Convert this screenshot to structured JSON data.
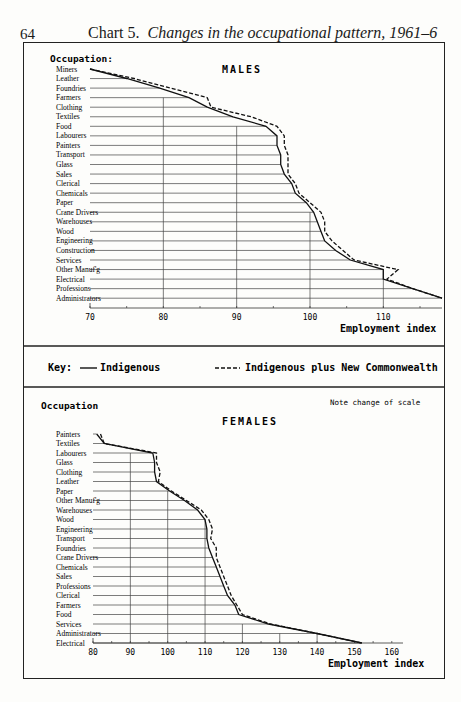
{
  "page_number": "64",
  "title_prefix": "Chart 5.",
  "title_text": "Changes in the occupational pattern, 1961–6",
  "key": {
    "label": "Key:",
    "solid_label": "Indigenous",
    "dashed_label": "Indigenous plus New Commonwealth"
  },
  "note": "Note change of scale",
  "chart_data": [
    {
      "type": "line",
      "title": "MALES",
      "ylabel": "Occupation:",
      "xlabel": "Employment index",
      "xlim": [
        70,
        118
      ],
      "xticks": [
        70,
        80,
        90,
        100,
        110
      ],
      "grid": true,
      "categories": [
        "Miners",
        "Leather",
        "Foundries",
        "Farmers",
        "Clothing",
        "Textiles",
        "Food",
        "Labourers",
        "Painters",
        "Transport",
        "Glass",
        "Sales",
        "Clerical",
        "Chemicals",
        "Paper",
        "Crane Drivers",
        "Warehouses",
        "Wood",
        "Engineering",
        "Construction",
        "Services",
        "Other Manuf'g",
        "Electrical",
        "Professions",
        "Administrators"
      ],
      "series": [
        {
          "name": "Indigenous",
          "style": "solid",
          "values": [
            70,
            75,
            79.5,
            83.5,
            86,
            89.5,
            94,
            95.5,
            95.5,
            96,
            96,
            96.5,
            97.5,
            98,
            99.5,
            100.5,
            101,
            101.5,
            102,
            103.5,
            105.5,
            110,
            110,
            114,
            118
          ]
        },
        {
          "name": "Indigenous plus New Commonwealth",
          "style": "dashed",
          "values": [
            70,
            76,
            81,
            86,
            86.5,
            92,
            95.5,
            96.5,
            96.5,
            97,
            97,
            97,
            98,
            98.5,
            100,
            101.5,
            102,
            102,
            103,
            104.5,
            106,
            112,
            110.5,
            114,
            118
          ]
        }
      ]
    },
    {
      "type": "line",
      "title": "FEMALES",
      "ylabel": "Occupation",
      "xlabel": "Employment index",
      "xlim": [
        80,
        163
      ],
      "xticks": [
        80,
        90,
        100,
        110,
        120,
        130,
        140,
        150,
        160
      ],
      "grid": true,
      "categories": [
        "Painters",
        "Textiles",
        "Labourers",
        "Glass",
        "Clothing",
        "Leather",
        "Paper",
        "Other Manuf'g",
        "Warehouses",
        "Wood",
        "Engineering",
        "Transport",
        "Foundries",
        "Crane Drivers",
        "Chemicals",
        "Sales",
        "Professions",
        "Clerical",
        "Farmers",
        "Food",
        "Services",
        "Administrators",
        "Electrical"
      ],
      "series": [
        {
          "name": "Indigenous",
          "style": "solid",
          "values": [
            81,
            83,
            96,
            96.5,
            96.5,
            97,
            100.5,
            104.5,
            108,
            110,
            110.5,
            110.5,
            111,
            112,
            113,
            114,
            115,
            116,
            118,
            119,
            127,
            140,
            152
          ]
        },
        {
          "name": "Indigenous plus New Commonwealth",
          "style": "dashed",
          "values": [
            82,
            83,
            97,
            97,
            98,
            97.5,
            101,
            105,
            109,
            111,
            112,
            111.5,
            113,
            113,
            114,
            115,
            116,
            117,
            118.5,
            120,
            127.5,
            140,
            152
          ]
        }
      ]
    }
  ]
}
